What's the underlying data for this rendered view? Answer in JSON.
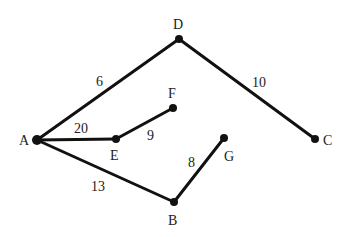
{
  "diagram": {
    "type": "weighted-graph",
    "nodes": [
      {
        "id": "A",
        "label": "A",
        "x": 37,
        "y": 140,
        "lx": 19,
        "ly": 145
      },
      {
        "id": "D",
        "label": "D",
        "x": 179,
        "y": 39,
        "lx": 173,
        "ly": 29
      },
      {
        "id": "C",
        "label": "C",
        "x": 315,
        "y": 139,
        "lx": 323,
        "ly": 145
      },
      {
        "id": "E",
        "label": "E",
        "x": 116,
        "y": 139,
        "lx": 110,
        "ly": 160
      },
      {
        "id": "F",
        "label": "F",
        "x": 173,
        "y": 108,
        "lx": 168,
        "ly": 98
      },
      {
        "id": "G",
        "label": "G",
        "x": 224,
        "y": 138,
        "lx": 224,
        "ly": 161
      },
      {
        "id": "B",
        "label": "B",
        "x": 174,
        "y": 202,
        "lx": 168,
        "ly": 225
      }
    ],
    "edges": [
      {
        "from": "A",
        "to": "D",
        "weight": "6",
        "lx": 96,
        "ly": 86
      },
      {
        "from": "D",
        "to": "C",
        "weight": "10",
        "lx": 252,
        "ly": 87
      },
      {
        "from": "A",
        "to": "E",
        "weight": "20",
        "lx": 74,
        "ly": 133
      },
      {
        "from": "E",
        "to": "F",
        "weight": "9",
        "lx": 147,
        "ly": 140
      },
      {
        "from": "A",
        "to": "B",
        "weight": "13",
        "lx": 91,
        "ly": 191
      },
      {
        "from": "B",
        "to": "G",
        "weight": "8",
        "lx": 188,
        "ly": 167
      }
    ]
  }
}
